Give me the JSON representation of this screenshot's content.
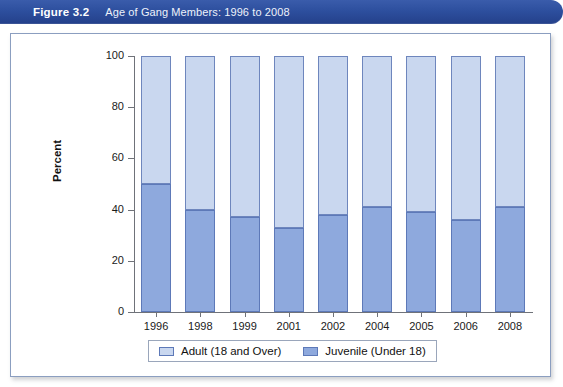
{
  "banner": {
    "figure_number": "Figure 3.2",
    "figure_title": "Age of Gang Members: 1996 to 2008",
    "banner_color": "#2d4f9e"
  },
  "chart_data": {
    "type": "bar",
    "stacked": true,
    "title": "Age of Gang Members: 1996 to 2008",
    "xlabel": "",
    "ylabel": "Percent",
    "ylim": [
      0,
      100
    ],
    "yticks": [
      0,
      20,
      40,
      60,
      80,
      100
    ],
    "grid": false,
    "legend_position": "bottom",
    "categories": [
      "1996",
      "1998",
      "1999",
      "2001",
      "2002",
      "2004",
      "2005",
      "2006",
      "2008"
    ],
    "series": [
      {
        "name": "Adult (18 and Over)",
        "color": "#c9d7ef",
        "border_color": "#6e86bd",
        "values": [
          50,
          60,
          63,
          67,
          62,
          59,
          61,
          64,
          59
        ]
      },
      {
        "name": "Juvenile (Under 18)",
        "color": "#8ea9dd",
        "border_color": "#5d79b8",
        "values": [
          50,
          40,
          37,
          33,
          38,
          41,
          39,
          36,
          41
        ]
      }
    ]
  },
  "legend": {
    "items": [
      {
        "label": "Adult (18 and Over)",
        "color": "#c9d7ef"
      },
      {
        "label": "Juvenile (Under 18)",
        "color": "#8ea9dd"
      }
    ]
  }
}
